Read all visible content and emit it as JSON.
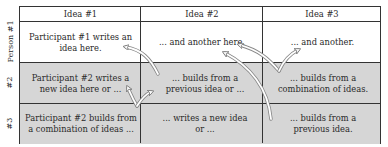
{
  "columns": [
    "Idea #1",
    "Idea #2",
    "Idea #3"
  ],
  "rows": [
    {
      "label": "Person #1",
      "cells": [
        "Participant #1 writes an idea here.",
        "... and another here.",
        "... and another."
      ],
      "shaded": false
    },
    {
      "label": "#2",
      "cells": [
        "Participant #2 writes a new idea here or ...",
        "... builds from a previous idea or ...",
        "... builds from a combination of ideas."
      ],
      "shaded": true
    },
    {
      "label": "#3",
      "cells": [
        "Participant #2 builds from a combination of ideas ...",
        "... writes a new idea or ...",
        "... builds from a previous idea."
      ],
      "shaded": true
    }
  ],
  "colors": {
    "grid_line": "#333333",
    "shaded_cell": "#d6d6d6",
    "arrow_fill": "#ffffff",
    "arrow_stroke": "#8a8a8a"
  }
}
